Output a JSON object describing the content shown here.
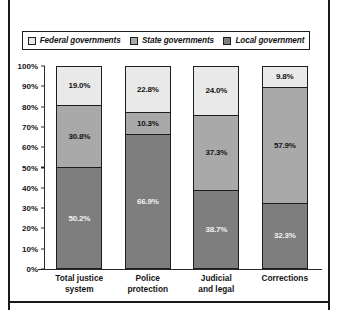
{
  "chart_data": {
    "type": "bar",
    "subtype": "stacked-percentage",
    "title": "",
    "subtitle": "",
    "xlabel": "",
    "ylabel": "",
    "ylim": [
      0,
      100
    ],
    "grid": false,
    "legend_position": "top",
    "categories": [
      "Total justice\nsystem",
      "Police\nprotection",
      "Judicial\nand legal",
      "Corrections"
    ],
    "category_lines": [
      [
        "Total justice",
        "system"
      ],
      [
        "Police",
        "protection"
      ],
      [
        "Judicial",
        "and legal"
      ],
      [
        "Corrections"
      ]
    ],
    "series": [
      {
        "name": "Federal governments",
        "color": "#e9e9e9",
        "text_color": "#141414",
        "values": [
          19.0,
          22.8,
          24.0,
          9.8
        ],
        "labels": [
          "19.0%",
          "22.8%",
          "24.0%",
          "9.8%"
        ]
      },
      {
        "name": "State governments",
        "color": "#a9a9a9",
        "text_color": "#141414",
        "values": [
          30.8,
          10.3,
          37.3,
          57.9
        ],
        "labels": [
          "30.8%",
          "10.3%",
          "37.3%",
          "57.9%"
        ]
      },
      {
        "name": "Local government",
        "color": "#7e7e7e",
        "text_color": "#f2f2f2",
        "values": [
          50.2,
          66.9,
          38.7,
          32.3
        ],
        "labels": [
          "50.2%",
          "66.9%",
          "38.7%",
          "32.3%"
        ]
      }
    ],
    "yticks": [
      "100%",
      "90%",
      "80%",
      "70%",
      "60%",
      "50%",
      "40%",
      "30%",
      "20%",
      "10%",
      "0%"
    ],
    "ytick_values": [
      100,
      90,
      80,
      70,
      60,
      50,
      40,
      30,
      20,
      10,
      0
    ]
  },
  "legend": {
    "items": [
      {
        "label": "Federal governments",
        "swatch": "#e9e9e9"
      },
      {
        "label": "State governments",
        "swatch": "#a9a9a9"
      },
      {
        "label": "Local government",
        "swatch": "#7e7e7e"
      }
    ]
  }
}
